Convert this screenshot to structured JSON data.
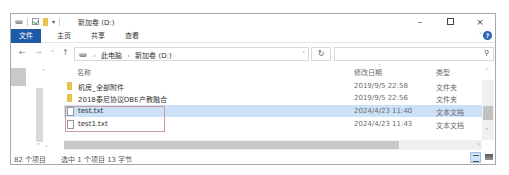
{
  "window": {
    "title": "新加卷 (D:)",
    "controls": {
      "minimize": "–",
      "maximize": "□",
      "close": "×"
    },
    "quick_access_icons": [
      "drive-icon",
      "properties-check-icon",
      "new-folder-icon",
      "customize-dropdown-icon"
    ]
  },
  "ribbon": {
    "tabs": [
      {
        "label": "文件",
        "active": true
      },
      {
        "label": "主页"
      },
      {
        "label": "共享"
      },
      {
        "label": "查看"
      }
    ],
    "expand_icon": "chevron-down-icon",
    "help": "?"
  },
  "navbar": {
    "back": "←",
    "forward": "→",
    "recent": "˅",
    "up": "↑",
    "breadcrumbs": [
      "此电脑",
      "新加卷 (D:)"
    ],
    "dropdown": "˅",
    "refresh": "↻",
    "search_placeholder": "",
    "search_icon": "⚲"
  },
  "columns": {
    "name": "名称",
    "date": "修改日期",
    "type": "类型",
    "sort_indicator": "ˇ"
  },
  "files": [
    {
      "name": "机房_全部附件",
      "date": "2019/9/5 22:58",
      "type": "文件夹",
      "icon": "folder",
      "selected": false
    },
    {
      "name": "2018泰尼协议OBE产教融合",
      "date": "2019/9/5 22:56",
      "type": "文件夹",
      "icon": "folder",
      "selected": false
    },
    {
      "name": "test.txt",
      "date": "2024/4/23 11:40",
      "type": "文本文档",
      "icon": "txt",
      "selected": true
    },
    {
      "name": "test1.txt",
      "date": "2024/4/23 11:43",
      "type": "文本文档",
      "icon": "txt",
      "selected": false
    }
  ],
  "status": {
    "item_count": "82 个项目",
    "selection": "选中 1 个项目  13 字节"
  },
  "accent": {
    "ribbon_file": "#1f5aa6",
    "selection": "#cce0f8",
    "highlight_box": "#c99b9b"
  }
}
